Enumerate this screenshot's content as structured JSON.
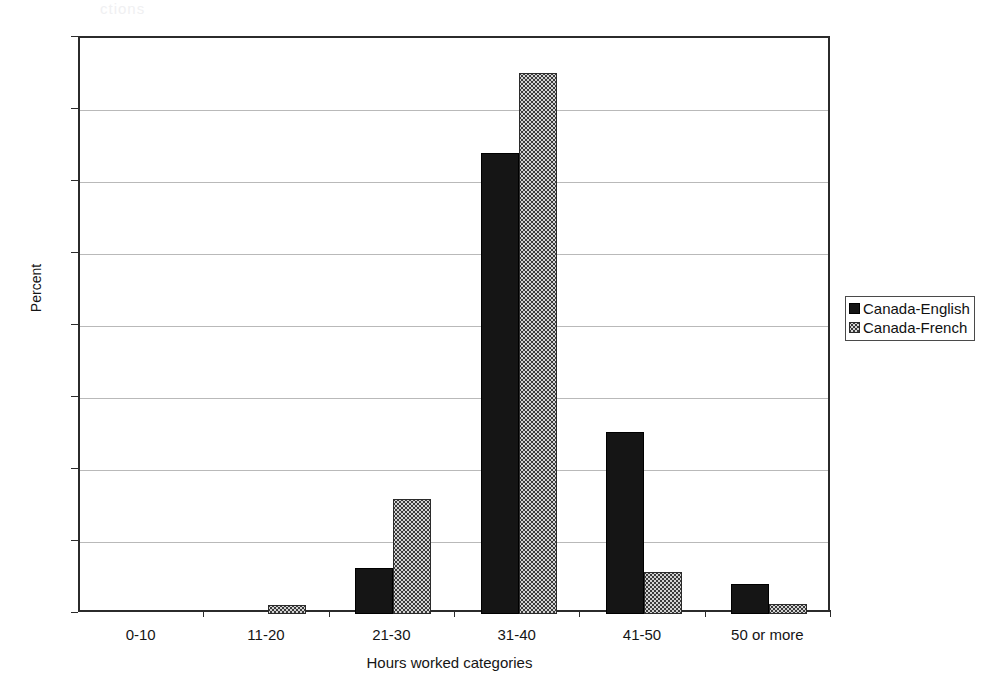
{
  "artifact": {
    "top_fragment": "ctions"
  },
  "chart_data": {
    "type": "bar",
    "title": "",
    "xlabel": "Hours worked categories",
    "ylabel": "Percent",
    "categories": [
      "0-10",
      "11-20",
      "21-30",
      "31-40",
      "41-50",
      "50 or more"
    ],
    "series": [
      {
        "name": "Canada-English",
        "color": "#151515",
        "fill": "solid-black",
        "values": [
          0,
          0,
          6.4,
          64.0,
          25.3,
          4.2
        ]
      },
      {
        "name": "Canada-French",
        "color": "#d2d2d2",
        "fill": "stippled-gray",
        "values": [
          0,
          1.3,
          16.0,
          75.1,
          5.8,
          1.4
        ]
      }
    ],
    "ylim": [
      0,
      80
    ],
    "ytick_step": 10,
    "yticks": [
      0,
      10,
      20,
      30,
      40,
      50,
      60,
      70,
      80
    ],
    "grid": true,
    "grid_axis": "y",
    "legend_position": "right"
  }
}
